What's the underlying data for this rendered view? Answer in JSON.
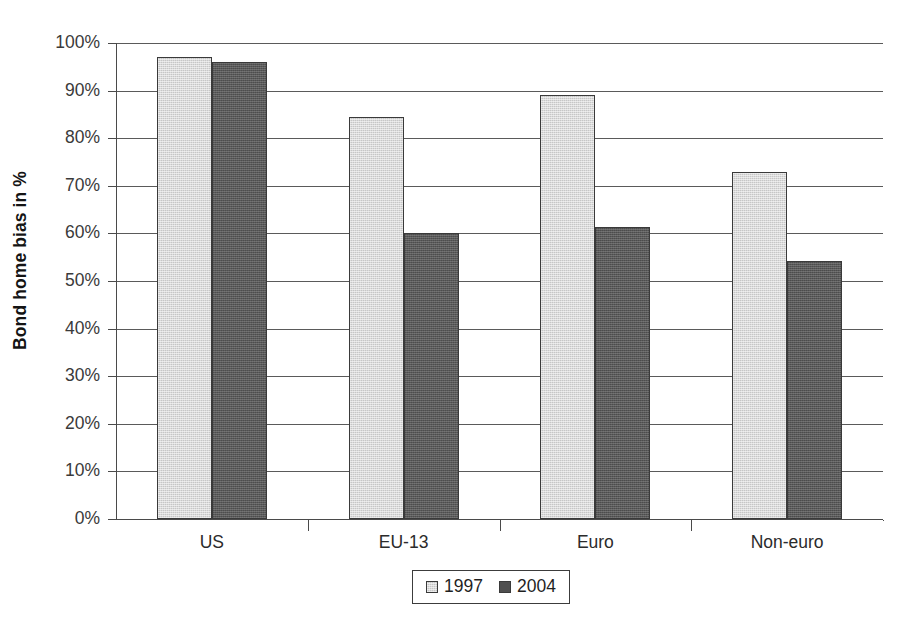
{
  "chart_data": {
    "type": "bar",
    "title": "",
    "xlabel": "",
    "ylabel": "Bond home bias in %",
    "categories": [
      "US",
      "EU-13",
      "Euro",
      "Non-euro"
    ],
    "series": [
      {
        "name": "1997",
        "color": "#c6c6c6",
        "values": [
          97,
          84.5,
          89,
          72.8
        ]
      },
      {
        "name": "2004",
        "color": "#595959",
        "values": [
          96,
          60,
          61.3,
          54.3
        ]
      }
    ],
    "ylim": [
      0,
      100
    ],
    "y_ticks": [
      "0%",
      "10%",
      "20%",
      "30%",
      "40%",
      "50%",
      "60%",
      "70%",
      "80%",
      "90%",
      "100%"
    ],
    "y_tick_values": [
      0,
      10,
      20,
      30,
      40,
      50,
      60,
      70,
      80,
      90,
      100
    ],
    "grid": true,
    "legend_position": "bottom-center",
    "legend_entries": [
      "1997",
      "2004"
    ]
  }
}
